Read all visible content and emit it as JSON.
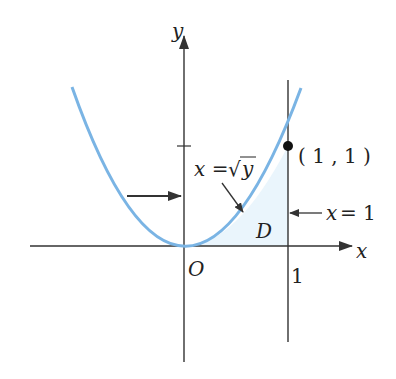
{
  "figure": {
    "axis_labels": {
      "x": "x",
      "y": "y"
    },
    "origin_label": "O",
    "tick_label_x": "1",
    "curve_label_lhs": "x =",
    "curve_label_sqrt": "√",
    "curve_label_rad": "y",
    "point_label": "( 1 , 1 )",
    "line_label_var": "x",
    "line_label_eq": "= 1",
    "region_label": "D",
    "colors": {
      "curve": "#7ab4e4",
      "region_fill": "#eaf5fc",
      "axes": "#333333",
      "point": "#111111"
    }
  }
}
